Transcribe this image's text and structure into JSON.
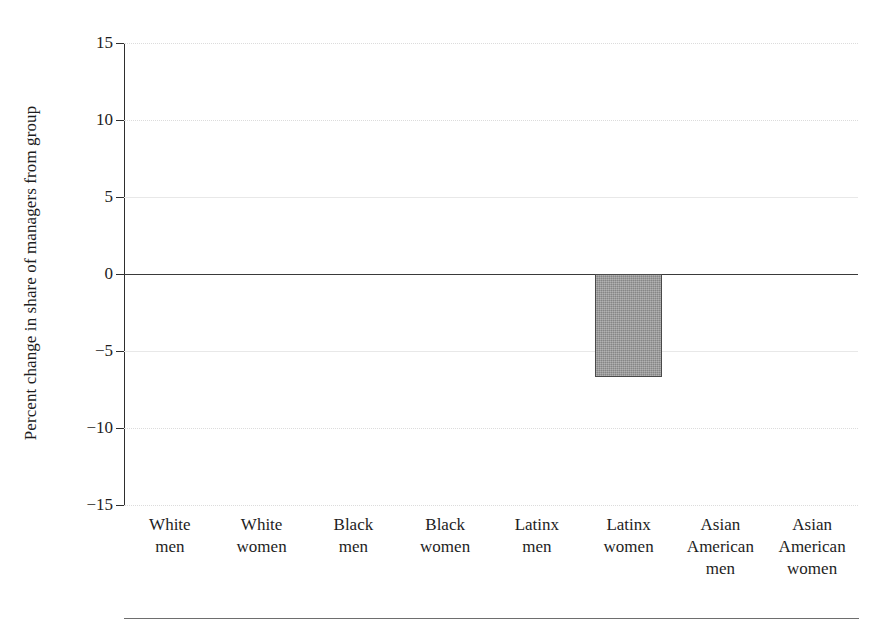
{
  "chart_data": {
    "type": "bar",
    "title": "",
    "xlabel": "",
    "ylabel": "Percent change in share of managers from group",
    "ylim": [
      -15,
      15
    ],
    "yticks": [
      15,
      10,
      5,
      0,
      -5,
      -10,
      -15
    ],
    "ytick_labels": [
      "15",
      "10",
      "5",
      "0",
      "−5",
      "−10",
      "−15"
    ],
    "grid": true,
    "legend": null,
    "zero_line": true,
    "categories": [
      "White men",
      "White women",
      "Black men",
      "Black women",
      "Latinx men",
      "Latinx women",
      "Asian American men",
      "Asian American women"
    ],
    "category_lines": [
      [
        "White",
        "men"
      ],
      [
        "White",
        "women"
      ],
      [
        "Black",
        "men"
      ],
      [
        "Black",
        "women"
      ],
      [
        "Latinx",
        "men"
      ],
      [
        "Latinx",
        "women"
      ],
      [
        "Asian",
        "American",
        "men"
      ],
      [
        "Asian",
        "American",
        "women"
      ]
    ],
    "values": [
      0,
      0,
      0,
      0,
      0,
      -6.7,
      0,
      0
    ],
    "bar_color": "#949494",
    "bar_edge_color": "#4a4a4a"
  },
  "footnote": {
    "text": ""
  }
}
